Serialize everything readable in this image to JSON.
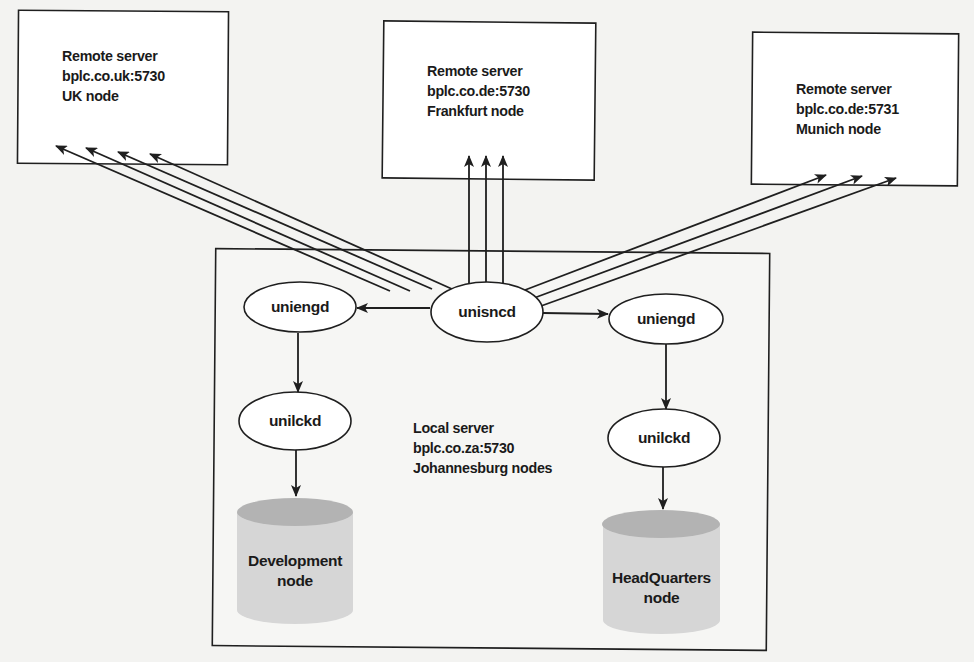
{
  "diagram": {
    "remote_servers": [
      {
        "id": "uk",
        "lines": [
          "Remote server",
          "bplc.co.uk:5730",
          "UK node"
        ]
      },
      {
        "id": "frankfurt",
        "lines": [
          "Remote server",
          "bplc.co.de:5730",
          "Frankfurt node"
        ]
      },
      {
        "id": "munich",
        "lines": [
          "Remote server",
          "bplc.co.de:5731",
          "Munich node"
        ]
      }
    ],
    "local_server": {
      "lines": [
        "Local server",
        "bplc.co.za:5730",
        "Johannesburg nodes"
      ]
    },
    "processes": {
      "unisncd": "unisncd",
      "uniengd_left": "uniengd",
      "uniengd_right": "uniengd",
      "unilckd_left": "unilckd",
      "unilckd_right": "unilckd"
    },
    "databases": [
      {
        "id": "development",
        "lines": [
          "Development",
          "node"
        ]
      },
      {
        "id": "headquarters",
        "lines": [
          "HeadQuarters",
          "node"
        ]
      }
    ],
    "connections": [
      {
        "from": "unisncd",
        "to": "uk",
        "count": 4
      },
      {
        "from": "unisncd",
        "to": "frankfurt",
        "count": 3
      },
      {
        "from": "unisncd",
        "to": "munich",
        "count": 3
      },
      {
        "from": "unisncd",
        "to": "uniengd_left"
      },
      {
        "from": "unisncd",
        "to": "uniengd_right"
      },
      {
        "from": "uniengd_left",
        "to": "unilckd_left"
      },
      {
        "from": "uniengd_right",
        "to": "unilckd_right"
      },
      {
        "from": "unilckd_left",
        "to": "development"
      },
      {
        "from": "unilckd_right",
        "to": "headquarters"
      }
    ],
    "colors": {
      "stroke": "#1f1f1f",
      "background": "#f3f3f1",
      "box_fill": "#ffffff",
      "db_body": "#d6d6d6",
      "db_top": "#b3b3b3"
    }
  }
}
